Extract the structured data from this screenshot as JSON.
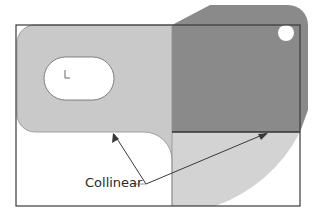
{
  "diagram": {
    "annotation": {
      "label": "Collinear",
      "points_to": [
        "light-part-bottom-edge",
        "dark-part-bottom-edge"
      ]
    },
    "colors": {
      "background": "#ffffff",
      "light_part": "#c9c9c9",
      "dark_part": "#8a8a8a",
      "lower_arc_region": "#d3d3d3",
      "outline": "#3a3a3a",
      "leader_line": "#3a3a3a"
    },
    "features": {
      "slot": "stadium-shaped cutout in light part",
      "hole": "circular hole in dark part",
      "origin_marker": "small coordinate axis glyph inside slot"
    }
  }
}
